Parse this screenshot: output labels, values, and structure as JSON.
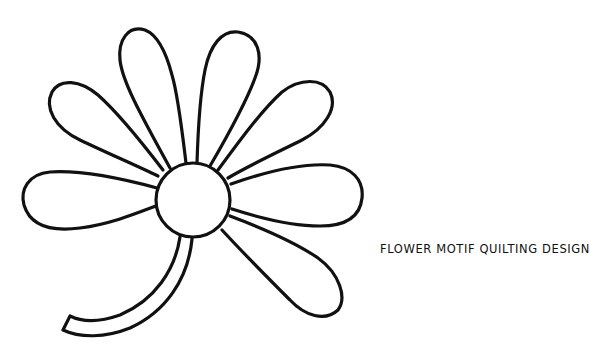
{
  "caption": "FLOWER MOTIF QUILTING DESIGN",
  "colors": {
    "stroke": "#111111",
    "background": "#ffffff"
  },
  "figure": {
    "center": {
      "cx": 193,
      "cy": 200,
      "r": 37
    },
    "petal_count": 8,
    "has_stem": true
  }
}
